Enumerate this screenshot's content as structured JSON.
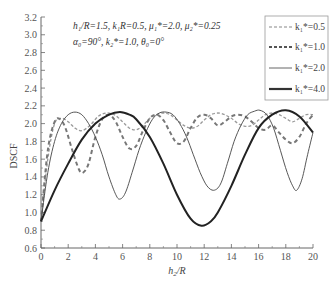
{
  "chart_data": {
    "type": "line",
    "title": "",
    "xlabel": "h2/R",
    "ylabel": "DSCF",
    "xlim": [
      0,
      20
    ],
    "ylim": [
      0.6,
      3.2
    ],
    "xticks": [
      0,
      2,
      4,
      6,
      8,
      10,
      12,
      14,
      16,
      18,
      20
    ],
    "yticks": [
      0.6,
      0.8,
      1.0,
      1.2,
      1.4,
      1.6,
      1.8,
      2.0,
      2.2,
      2.4,
      2.6,
      2.8,
      3.0,
      3.2
    ],
    "grid": false,
    "legend_position": "upper right",
    "annotations": [
      "h1/R=1.5, k1R=0.5, μ1*=2.0, μ2*=0.25",
      "α0=90°, k2*=1.0, θ0=0°"
    ],
    "series": [
      {
        "name": "k1*=0.5",
        "style": "dashed-fine",
        "x": [
          0,
          0.5,
          1.0,
          1.5,
          2.0,
          2.5,
          3.0,
          3.6,
          4.2,
          4.8,
          5.4,
          6.0,
          6.5,
          7.0,
          7.5,
          8.0,
          8.5,
          9.0,
          9.5,
          10.0,
          10.5,
          11.0,
          11.5,
          12.0,
          12.5,
          13.0,
          13.5,
          14.0,
          14.5,
          15.0,
          15.5,
          16.0,
          16.5,
          17.0,
          17.5,
          18.0,
          18.5,
          19.0,
          19.5,
          20.0
        ],
        "y": [
          0.9,
          1.6,
          2.0,
          2.06,
          2.02,
          1.95,
          1.92,
          1.98,
          2.08,
          2.12,
          2.1,
          2.02,
          1.95,
          1.93,
          1.98,
          2.06,
          2.1,
          2.12,
          2.1,
          2.04,
          1.98,
          1.95,
          1.97,
          2.04,
          2.1,
          2.12,
          2.1,
          2.06,
          2.0,
          1.97,
          1.98,
          2.04,
          2.1,
          2.12,
          2.1,
          2.06,
          2.02,
          2.06,
          2.1,
          2.1
        ]
      },
      {
        "name": "k1*=1.0",
        "style": "dashed-bold",
        "x": [
          0,
          0.5,
          1.0,
          1.4,
          1.8,
          2.3,
          2.8,
          3.1,
          3.5,
          4.0,
          4.5,
          5.0,
          5.5,
          6.0,
          6.5,
          7.0,
          7.5,
          8.0,
          8.5,
          9.0,
          9.5,
          10.0,
          10.5,
          11.0,
          11.5,
          12.0,
          12.5,
          13.0,
          13.5,
          14.0,
          14.5,
          15.0,
          15.5,
          16.0,
          16.5,
          17.0,
          17.5,
          18.0,
          18.5,
          19.0,
          19.5,
          20.0
        ],
        "y": [
          0.9,
          1.7,
          2.02,
          2.05,
          1.95,
          1.7,
          1.48,
          1.45,
          1.55,
          1.85,
          2.05,
          2.1,
          2.02,
          1.85,
          1.72,
          1.75,
          1.92,
          2.06,
          2.1,
          2.04,
          1.9,
          1.78,
          1.8,
          1.95,
          2.07,
          2.1,
          2.06,
          1.98,
          2.02,
          2.08,
          2.1,
          2.08,
          2.02,
          1.95,
          1.93,
          1.98,
          1.9,
          1.82,
          1.78,
          1.85,
          2.0,
          2.1
        ]
      },
      {
        "name": "k1*=2.0",
        "style": "solid-thin",
        "x": [
          0,
          0.5,
          1.0,
          1.5,
          2.0,
          2.5,
          3.0,
          3.5,
          4.0,
          4.5,
          5.0,
          5.5,
          5.8,
          6.2,
          6.7,
          7.2,
          7.7,
          8.2,
          8.7,
          9.2,
          9.7,
          10.2,
          10.7,
          11.2,
          11.7,
          12.2,
          12.7,
          13.2,
          13.7,
          14.2,
          14.7,
          15.2,
          15.7,
          16.1,
          16.6,
          17.1,
          17.6,
          18.1,
          18.5,
          18.8,
          19.2,
          19.6,
          20.0
        ],
        "y": [
          0.9,
          1.45,
          1.8,
          2.0,
          2.1,
          2.13,
          2.1,
          2.0,
          1.85,
          1.65,
          1.4,
          1.2,
          1.15,
          1.22,
          1.45,
          1.7,
          1.9,
          2.05,
          2.12,
          2.13,
          2.1,
          2.0,
          1.85,
          1.65,
          1.45,
          1.3,
          1.25,
          1.32,
          1.55,
          1.8,
          1.98,
          2.1,
          2.14,
          2.15,
          2.1,
          1.95,
          1.7,
          1.45,
          1.3,
          1.25,
          1.38,
          1.65,
          1.9
        ]
      },
      {
        "name": "k1*=4.0",
        "style": "solid-thick",
        "x": [
          0,
          1,
          2,
          3,
          4,
          5,
          5.8,
          6.5,
          7,
          8,
          9,
          10,
          11,
          11.8,
          12.5,
          13,
          14,
          15,
          16,
          17,
          18,
          19,
          20
        ],
        "y": [
          0.9,
          1.25,
          1.55,
          1.82,
          2.0,
          2.1,
          2.13,
          2.1,
          2.05,
          1.85,
          1.55,
          1.2,
          0.93,
          0.85,
          0.9,
          1.0,
          1.3,
          1.65,
          1.95,
          2.1,
          2.15,
          2.08,
          1.9
        ]
      }
    ]
  },
  "labels": {
    "ylabel": "DSCF",
    "xlabel_main": "h",
    "xlabel_sub": "2",
    "xlabel_rest": "/R",
    "ann1": "h₁/R=1.5, k₁R=0.5, μ₁*=2.0, μ₂*=0.25",
    "ann2": "α₀=90°, k₂*=1.0, θ₀=0°",
    "legend": [
      "k₁*=0.5",
      "k₁*=1.0",
      "k₁*=2.0",
      "k₁*=4.0"
    ]
  }
}
